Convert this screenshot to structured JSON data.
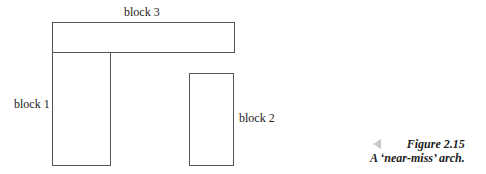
{
  "diagram": {
    "blocks": [
      {
        "id": "block-1",
        "label": "block 1"
      },
      {
        "id": "block-2",
        "label": "block 2"
      },
      {
        "id": "block-3",
        "label": "block 3"
      }
    ]
  },
  "caption": {
    "figure": "Figure 2.15",
    "title": "A ‘near-miss’ arch."
  }
}
